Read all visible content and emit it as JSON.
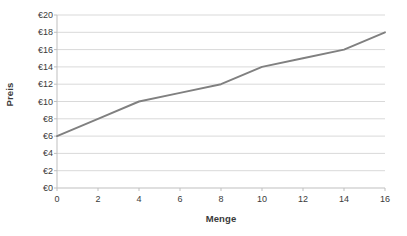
{
  "chart_data": {
    "type": "line",
    "title": "",
    "xlabel": "Menge",
    "ylabel": "Preis",
    "xlim": [
      0,
      16
    ],
    "ylim": [
      0,
      20
    ],
    "grid": "horizontal",
    "legend": "none",
    "series": [
      {
        "name": "Preis",
        "color": "#808080",
        "x": [
          0,
          2,
          4,
          6,
          8,
          10,
          12,
          14,
          16
        ],
        "values": [
          6,
          8,
          10,
          11,
          12,
          14,
          15,
          16,
          18
        ]
      }
    ],
    "x_tick_labels": [
      "0",
      "2",
      "4",
      "6",
      "8",
      "10",
      "12",
      "14",
      "16"
    ],
    "x_tick_values": [
      0,
      2,
      4,
      6,
      8,
      10,
      12,
      14,
      16
    ],
    "y_tick_labels": [
      "€0",
      "€2",
      "€4",
      "€6",
      "€8",
      "€10",
      "€12",
      "€14",
      "€16",
      "€18",
      "€20"
    ],
    "y_tick_values": [
      0,
      2,
      4,
      6,
      8,
      10,
      12,
      14,
      16,
      18,
      20
    ],
    "colors": {
      "line": "#808080",
      "gridline": "#d9d9d9",
      "axis": "#bfbfbf",
      "text": "#3a3a3a",
      "background": "#ffffff"
    }
  }
}
